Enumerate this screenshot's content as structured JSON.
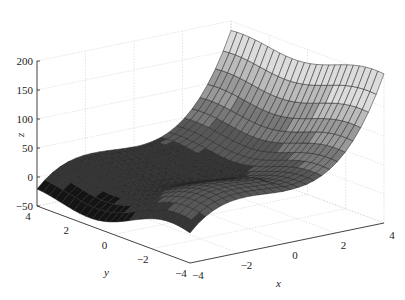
{
  "chart_data": {
    "type": "surface3d",
    "title": "",
    "xlabel": "x",
    "ylabel": "y",
    "zlabel": "z",
    "xlim": [
      -4,
      4
    ],
    "ylim": [
      -4,
      4
    ],
    "zlim": [
      -50,
      200
    ],
    "x_ticks": [
      "−4",
      "−2",
      "0",
      "2",
      "4"
    ],
    "y_ticks": [
      "4",
      "2",
      "0",
      "−2",
      "−4"
    ],
    "z_ticks": [
      "200",
      "150",
      "100",
      "50",
      "0",
      "−50"
    ],
    "grid": true,
    "colormap": "gray",
    "mesh_size": [
      25,
      25
    ],
    "surface_samples": {
      "corner_x-4_y4": 0,
      "corner_x-4_y-4": -30,
      "corner_x4_y4": 140,
      "corner_x4_y-4": 170
    }
  },
  "axes": {
    "x_label": "x",
    "y_label": "y",
    "z_label": "z"
  }
}
